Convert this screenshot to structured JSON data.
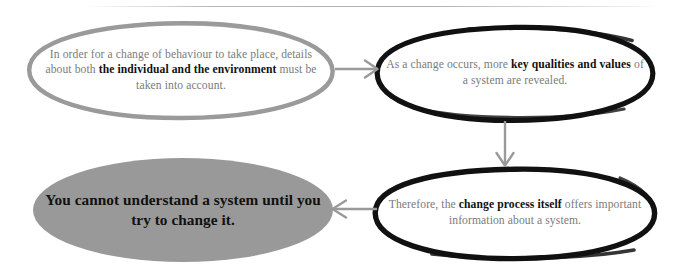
{
  "diagram": {
    "title_rule": "",
    "nodes": [
      {
        "id": "behaviour",
        "name": "node-behaviour",
        "style": "gray-outline-ellipse",
        "stroke_color": "#9a9a9a",
        "text_color": "#7b7b7b",
        "bold_color": "#111111",
        "segments": [
          {
            "text": "In order for a change of behaviour to take place, details about both ",
            "bold": false
          },
          {
            "text": "the individual and the environment",
            "bold": true
          },
          {
            "text": " must be taken into account.",
            "bold": false
          }
        ],
        "plain_text": "In order for a change of behaviour to take place, details about both the individual and the environment must be taken into account."
      },
      {
        "id": "qualities",
        "name": "node-qualities",
        "style": "black-outline-ellipse",
        "stroke_color": "#111111",
        "text_color": "#7b7b7b",
        "bold_color": "#111111",
        "segments": [
          {
            "text": "As a change occurs, more ",
            "bold": false
          },
          {
            "text": "key qualities and values",
            "bold": true
          },
          {
            "text": " of a system are revealed.",
            "bold": false
          }
        ],
        "plain_text": "As a change occurs, more key qualities and values of a system are revealed."
      },
      {
        "id": "process",
        "name": "node-process",
        "style": "black-outline-ellipse",
        "stroke_color": "#111111",
        "text_color": "#7b7b7b",
        "bold_color": "#111111",
        "segments": [
          {
            "text": "Therefore, the ",
            "bold": false
          },
          {
            "text": "change process itself",
            "bold": true
          },
          {
            "text": " offers important information about a system.",
            "bold": false
          }
        ],
        "plain_text": "Therefore, the change process itself offers important information about a system."
      },
      {
        "id": "conclusion",
        "name": "node-conclusion",
        "style": "gray-filled-ellipse",
        "fill_color": "#999999",
        "text_color": "#0b0b0b",
        "segments": [
          {
            "text": "You cannot understand a system until you try to change it.",
            "bold": true
          }
        ],
        "plain_text": "You cannot understand a system until you try to change it."
      }
    ],
    "arrows": [
      {
        "id": "arrow-right",
        "name": "arrow-behaviour-to-qualities",
        "direction": "right",
        "color": "#9a9a9a"
      },
      {
        "id": "arrow-down",
        "name": "arrow-qualities-to-process",
        "direction": "down",
        "color": "#9a9a9a"
      },
      {
        "id": "arrow-left",
        "name": "arrow-process-to-conclusion",
        "direction": "left",
        "color": "#9a9a9a"
      }
    ]
  }
}
